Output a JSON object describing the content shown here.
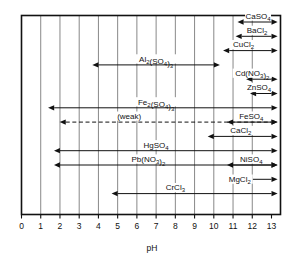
{
  "chart_data": {
    "type": "bar",
    "title": "",
    "xlabel": "pH",
    "ylabel": "",
    "xlim": [
      0,
      13
    ],
    "ylim": [
      0,
      14
    ],
    "grid": true,
    "legend": "none",
    "x_ticks": [
      "0",
      "1",
      "2",
      "3",
      "4",
      "5",
      "6",
      "7",
      "8",
      "9",
      "10",
      "11",
      "12",
      "13"
    ],
    "orientation": "horizontal-range-bars",
    "annotations": [
      "(weak)"
    ],
    "series": [
      {
        "name": "CaSO4",
        "label": "CaSO",
        "sub": "4",
        "label_parts": [
          {
            "t": "CaSO",
            "s": false
          },
          {
            "t": "4",
            "s": true
          }
        ],
        "start": 11.55,
        "end": 13.0,
        "label_x": 12.3,
        "row": 0,
        "style": "solid",
        "label_pos": "above",
        "arrows": "both"
      },
      {
        "name": "BaCl2",
        "label_parts": [
          {
            "t": "BaCl",
            "s": false
          },
          {
            "t": "2",
            "s": true
          }
        ],
        "start": 11.45,
        "end": 13.0,
        "label_x": 12.25,
        "row": 1,
        "style": "solid",
        "label_pos": "above",
        "arrows": "both"
      },
      {
        "name": "CuCl2",
        "label_parts": [
          {
            "t": "CuCl",
            "s": false
          },
          {
            "t": "2",
            "s": true
          }
        ],
        "start": 10.8,
        "end": 13.0,
        "label_x": 11.55,
        "row": 2,
        "style": "solid",
        "label_pos": "above",
        "arrows": "both"
      },
      {
        "name": "Al2(SO4)3",
        "label_parts": [
          {
            "t": "Al",
            "s": false
          },
          {
            "t": "2",
            "s": true
          },
          {
            "t": "(SO",
            "s": false
          },
          {
            "t": "4",
            "s": true
          },
          {
            "t": ")",
            "s": false
          },
          {
            "t": "3",
            "s": true
          }
        ],
        "start": 4.0,
        "end": 10.0,
        "label_x": 7.0,
        "row": 3,
        "style": "solid",
        "label_pos": "above",
        "arrows": "both"
      },
      {
        "name": "Cd(NO3)2",
        "label_parts": [
          {
            "t": "Cd(NO",
            "s": false
          },
          {
            "t": "3",
            "s": true
          },
          {
            "t": ")",
            "s": false
          },
          {
            "t": "2",
            "s": true
          }
        ],
        "start": 12.0,
        "end": 13.0,
        "label_x": 12.0,
        "row": 4,
        "style": "solid",
        "label_pos": "below",
        "arrows": "both"
      },
      {
        "name": "ZnSO4",
        "label_parts": [
          {
            "t": "ZnSO",
            "s": false
          },
          {
            "t": "4",
            "s": true
          }
        ],
        "start": 12.2,
        "end": 13.0,
        "label_x": 12.35,
        "row": 5,
        "style": "solid",
        "label_pos": "above",
        "arrows": "both"
      },
      {
        "name": "Fe2(SO4)3",
        "label_parts": [
          {
            "t": "Fe",
            "s": false
          },
          {
            "t": "2",
            "s": true
          },
          {
            "t": "(SO",
            "s": false
          },
          {
            "t": "4",
            "s": true
          },
          {
            "t": ")",
            "s": false
          },
          {
            "t": "3",
            "s": true
          }
        ],
        "start": 1.7,
        "end": 13.0,
        "label_x": 7.0,
        "row": 6,
        "style": "solid",
        "label_pos": "above",
        "arrows": "both"
      },
      {
        "name": "weak",
        "label_parts": [
          {
            "t": "(weak)",
            "s": false
          }
        ],
        "start": 2.3,
        "end": 13.0,
        "label_x": 5.6,
        "row": 7,
        "style": "dashed",
        "label_pos": "above",
        "arrows": "both"
      },
      {
        "name": "FeSO4",
        "label_parts": [
          {
            "t": "FeSO",
            "s": false
          },
          {
            "t": "4",
            "s": true
          }
        ],
        "start": 11.0,
        "end": 13.0,
        "label_x": 11.95,
        "row": 7,
        "style": "solid",
        "label_pos": "above",
        "arrows": "both"
      },
      {
        "name": "CaCl2",
        "label_parts": [
          {
            "t": "CaCl",
            "s": false
          },
          {
            "t": "2",
            "s": true
          }
        ],
        "start": 10.0,
        "end": 13.0,
        "label_x": 11.4,
        "row": 8,
        "style": "solid",
        "label_pos": "above",
        "arrows": "both"
      },
      {
        "name": "HgSO4",
        "label_parts": [
          {
            "t": "HgSO",
            "s": false
          },
          {
            "t": "4",
            "s": true
          }
        ],
        "start": 2.0,
        "end": 13.0,
        "label_x": 7.0,
        "row": 9,
        "style": "solid",
        "label_pos": "above",
        "arrows": "both"
      },
      {
        "name": "NiSO4",
        "label_parts": [
          {
            "t": "NiSO",
            "s": false
          },
          {
            "t": "4",
            "s": true
          }
        ],
        "start": 11.0,
        "end": 13.0,
        "label_x": 11.95,
        "row": 10,
        "style": "solid",
        "label_pos": "above",
        "arrows": "both"
      },
      {
        "name": "Pb(NO3)2",
        "label_parts": [
          {
            "t": "Pb(NO",
            "s": false
          },
          {
            "t": "3",
            "s": true
          },
          {
            "t": ")",
            "s": false
          },
          {
            "t": "2",
            "s": true
          }
        ],
        "start": 2.0,
        "end": 13.0,
        "label_x": 6.6,
        "row": 10,
        "style": "solid",
        "label_pos": "above",
        "arrows": "both"
      },
      {
        "name": "MgCl2",
        "label_parts": [
          {
            "t": "MgCl",
            "s": false
          },
          {
            "t": "2",
            "s": true
          }
        ],
        "start": 12.0,
        "end": 13.0,
        "label_x": 11.35,
        "row": 11,
        "style": "solid",
        "label_pos": "left",
        "arrows": "both"
      },
      {
        "name": "CrCl3",
        "label_parts": [
          {
            "t": "CrCl",
            "s": false
          },
          {
            "t": "3",
            "s": true
          }
        ],
        "start": 5.0,
        "end": 13.0,
        "label_x": 8.0,
        "row": 12,
        "style": "solid",
        "label_pos": "above",
        "arrows": "both"
      }
    ]
  },
  "axis": {
    "label": "pH"
  }
}
